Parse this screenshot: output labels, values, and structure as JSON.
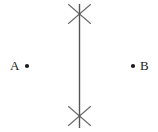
{
  "figure": {
    "kind": "geometry-construction",
    "width": 158,
    "height": 132,
    "background_color": "#ffffff",
    "ink_color": "#555555",
    "label_color": "#1a1a1a"
  },
  "points": [
    {
      "id": "A",
      "label": "A",
      "label_x": 10,
      "label_y": 59,
      "dot_x": 27,
      "dot_y": 66,
      "dot_radius": 2.1,
      "label_side": "left"
    },
    {
      "id": "B",
      "label": "B",
      "label_x": 140,
      "label_y": 59,
      "dot_x": 133,
      "dot_y": 66,
      "dot_radius": 2.1,
      "label_side": "right"
    }
  ],
  "bisector_line": {
    "name": "perpendicular-bisector",
    "x1": 79.5,
    "y1": 4,
    "x2": 79.5,
    "y2": 128,
    "stroke_width": 1.4,
    "color": "#555555"
  },
  "arc_crossings": [
    {
      "id": "top",
      "center_x": 79.5,
      "center_y": 14,
      "strokes": [
        {
          "x1": 68.5,
          "y1": 4.5,
          "x2": 90.5,
          "y2": 23.5
        },
        {
          "x1": 90.5,
          "y1": 4.5,
          "x2": 68.5,
          "y2": 23.5
        }
      ],
      "stroke_width": 1.1,
      "color": "#6b6b6b"
    },
    {
      "id": "bottom",
      "center_x": 79.5,
      "center_y": 116,
      "strokes": [
        {
          "x1": 68.5,
          "y1": 106.5,
          "x2": 90.5,
          "y2": 125.5
        },
        {
          "x1": 90.5,
          "y1": 106.5,
          "x2": 68.5,
          "y2": 125.5
        }
      ],
      "stroke_width": 1.1,
      "color": "#6b6b6b"
    }
  ]
}
